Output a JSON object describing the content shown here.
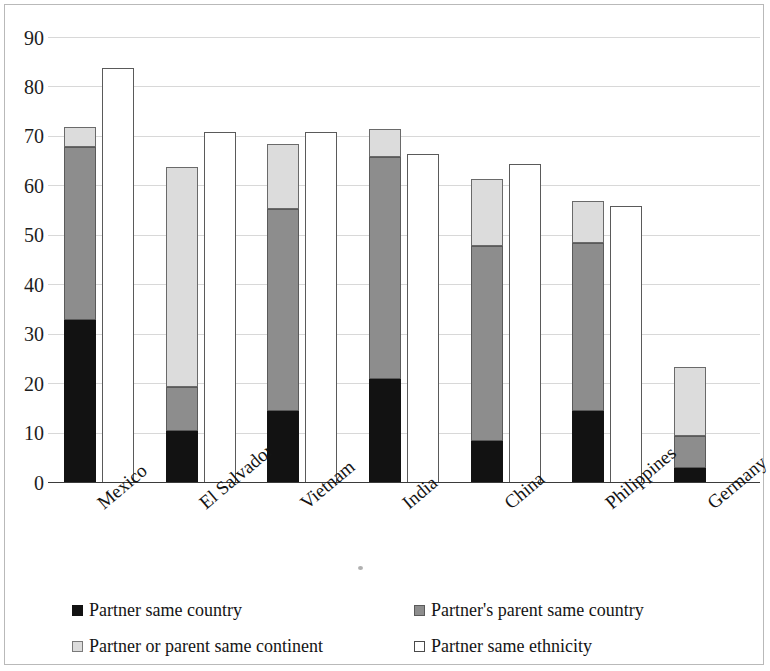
{
  "chart_data": {
    "type": "bar",
    "subtype": "stacked-and-grouped",
    "title": "",
    "subtitle": "",
    "xlabel": "",
    "ylabel": "",
    "ylim": [
      0,
      90
    ],
    "ytick_step": 10,
    "yticks": [
      "90",
      "80",
      "70",
      "60",
      "50",
      "40",
      "30",
      "20",
      "10",
      "0"
    ],
    "grid": true,
    "legend_position": "bottom",
    "categories": [
      "Mexico",
      "El Salvador",
      "Vietnam",
      "India",
      "China",
      "Philippines",
      "Germany"
    ],
    "series": [
      {
        "name": "Partner same country",
        "stack": "homogamy",
        "color": "#121212",
        "values": [
          33.0,
          10.5,
          14.5,
          21.0,
          8.5,
          14.5,
          3.0
        ]
      },
      {
        "name": "Partner's parent same country",
        "stack": "homogamy",
        "color": "#8d8d8d",
        "values": [
          35.0,
          9.0,
          41.0,
          45.0,
          39.5,
          34.0,
          6.5
        ],
        "cumulative_tops": [
          68.0,
          19.5,
          55.5,
          66.0,
          48.0,
          48.5,
          9.5
        ]
      },
      {
        "name": "Partner or parent same continent",
        "stack": "homogamy",
        "color": "#dcdcdc",
        "values": [
          4.0,
          44.5,
          13.0,
          5.5,
          13.5,
          8.5,
          14.0
        ],
        "cumulative_tops": [
          72.0,
          64.0,
          68.5,
          71.5,
          61.5,
          57.0,
          23.5
        ]
      },
      {
        "name": "Partner same ethnicity",
        "stack": "ethnicity",
        "color": "#ffffff",
        "values": [
          84.0,
          71.0,
          71.0,
          66.5,
          64.5,
          56.0,
          null
        ]
      }
    ],
    "stack_totals": [
      72.0,
      64.0,
      68.5,
      71.5,
      61.5,
      57.0,
      23.5
    ]
  },
  "legend": {
    "items": [
      {
        "label": "Partner same country",
        "swatch": "black-swatch-icon"
      },
      {
        "label": "Partner's parent same country",
        "swatch": "gray-swatch-icon"
      },
      {
        "label": "Partner or parent same continent",
        "swatch": "light-gray-swatch-icon"
      },
      {
        "label": "Partner same ethnicity",
        "swatch": "white-swatch-icon"
      }
    ]
  }
}
